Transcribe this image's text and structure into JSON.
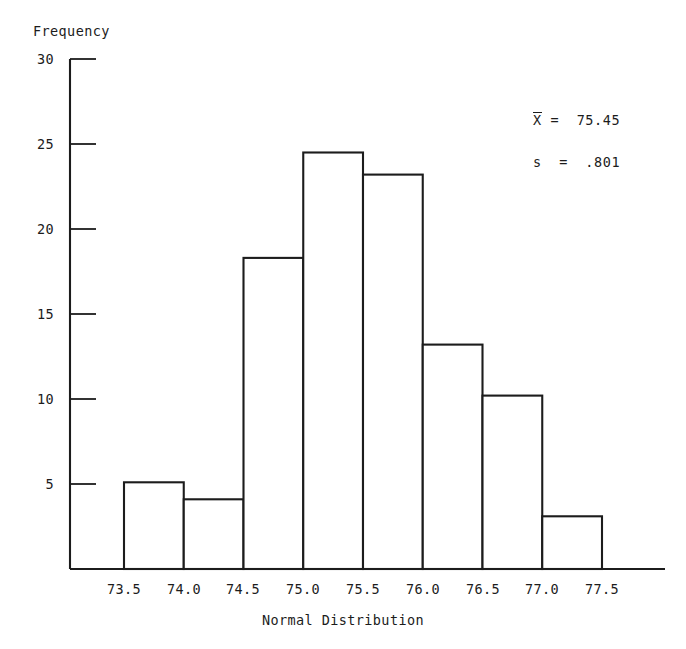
{
  "chart_data": {
    "type": "bar",
    "title": "",
    "subtitle": "",
    "xlabel": "Normal Distribution",
    "ylabel": "Frequency",
    "bin_edges": [
      73.5,
      74.0,
      74.5,
      75.0,
      75.5,
      76.0,
      76.5,
      77.0,
      77.5
    ],
    "categories": [
      "73.5-74.0",
      "74.0-74.5",
      "74.5-75.0",
      "75.0-75.5",
      "75.5-76.0",
      "76.0-76.5",
      "76.5-77.0",
      "77.0-77.5"
    ],
    "values": [
      5.1,
      4.1,
      18.3,
      24.5,
      23.2,
      13.2,
      10.2,
      3.1
    ],
    "xtick_labels": [
      "73.5",
      "74.0",
      "74.5",
      "75.0",
      "75.5",
      "76.0",
      "76.5",
      "77.0",
      "77.5"
    ],
    "ytick_labels": [
      "30",
      "25",
      "20",
      "15",
      "10",
      "5"
    ],
    "ytick_values": [
      30,
      25,
      20,
      15,
      10,
      5
    ],
    "ylim": [
      0,
      30
    ],
    "xlim": [
      73.5,
      77.5
    ],
    "grid": false,
    "legend": false,
    "bar_fill": "#ffffff",
    "bar_stroke": "#1c1c1c",
    "axis_color": "#1c1c1c",
    "background": "#ffffff",
    "annotations": [
      {
        "name": "mean",
        "symbol": "X",
        "overbar": true,
        "operator": "=",
        "value": "75.45",
        "text": "X̅ = 75.45"
      },
      {
        "name": "std-dev",
        "symbol": "s",
        "overbar": false,
        "operator": "=",
        "value": ".801",
        "text": "s = .801"
      }
    ]
  },
  "annot": {
    "mean_symbol": "X",
    "mean_rest": " =  75.45",
    "sd_text": "s  =  .801"
  }
}
